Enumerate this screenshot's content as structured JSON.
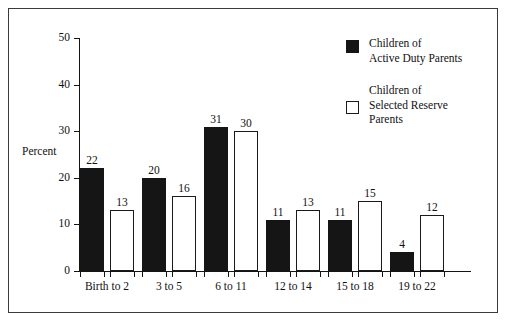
{
  "chart_data": {
    "type": "bar",
    "title": "",
    "xlabel": "",
    "ylabel": "Percent",
    "ylim": [
      0,
      50
    ],
    "yticks": [
      "0",
      "10",
      "20",
      "30",
      "40",
      "50"
    ],
    "grid": false,
    "legend_position": "top-right",
    "categories": [
      "Birth to 2",
      "3 to 5",
      "6 to 11",
      "12 to 14",
      "15 to 18",
      "19 to 22"
    ],
    "series": [
      {
        "name": "Children of\nActive Duty Parents",
        "style": "filled",
        "color": "#151515",
        "values": [
          22,
          20,
          31,
          11,
          11,
          4
        ]
      },
      {
        "name": "Children of\nSelected Reserve\nParents",
        "style": "open",
        "color": "#ffffff",
        "values": [
          13,
          16,
          30,
          13,
          15,
          12
        ]
      }
    ]
  },
  "legend": {
    "entries": [
      {
        "label": "Children of\nActive Duty Parents"
      },
      {
        "label": "Children of\nSelected Reserve\nParents"
      }
    ]
  }
}
